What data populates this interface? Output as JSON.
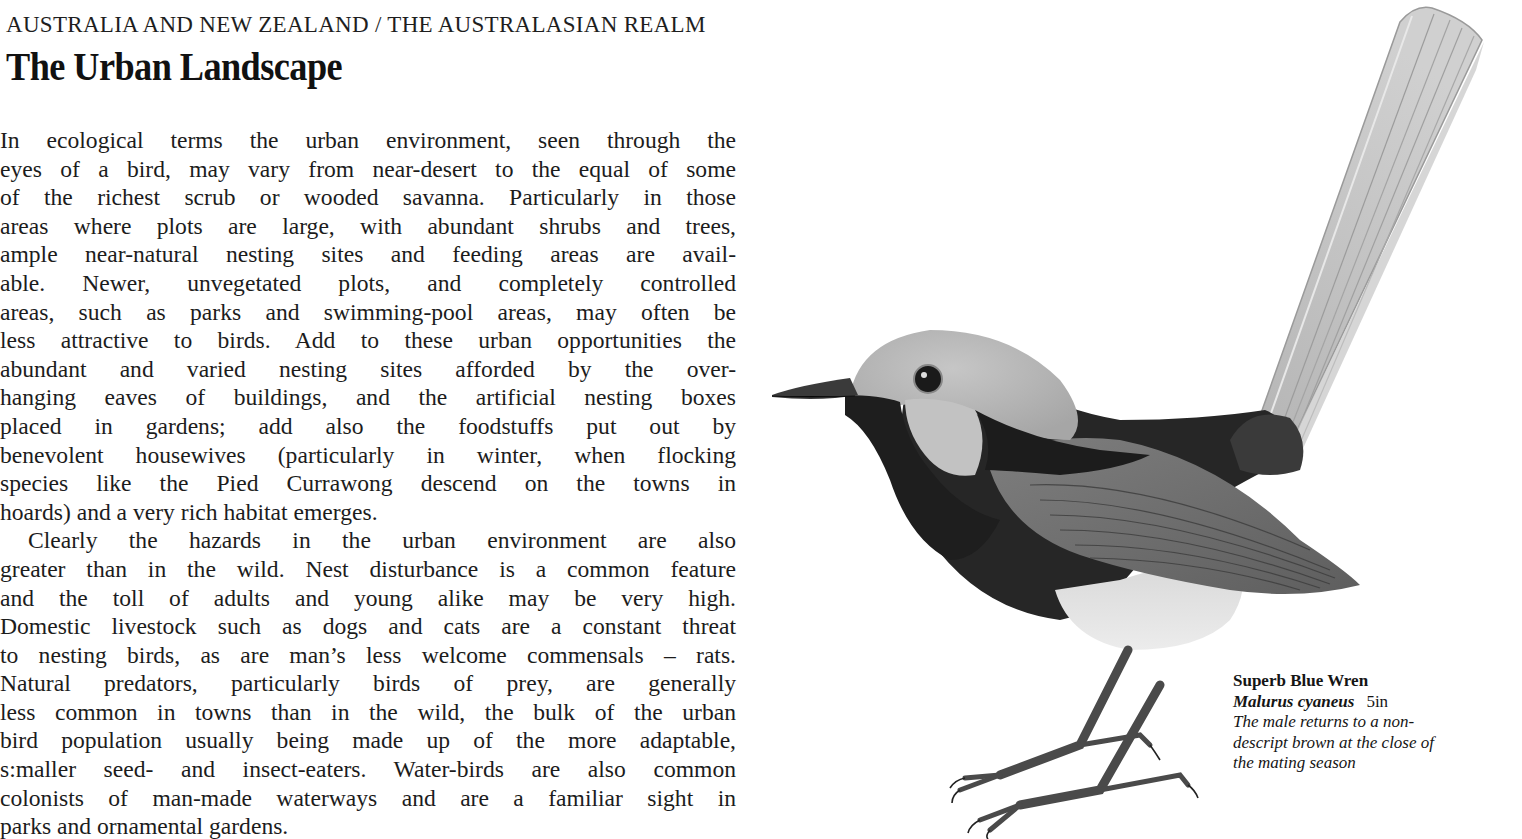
{
  "page": {
    "running_head": "AUSTRALIA AND NEW ZEALAND / THE AUSTRALASIAN REALM",
    "title": "The Urban Landscape"
  },
  "body": {
    "paragraphs": [
      {
        "lines": [
          "In ecological terms the urban environment, seen through the",
          "eyes of a bird, may vary from near-desert to the equal of some",
          "of the richest scrub or wooded savanna. Particularly in those",
          "areas where plots are large, with abundant shrubs and trees,",
          "ample near-natural nesting sites and feeding areas are avail-",
          "able. Newer, unvegetated plots, and completely controlled",
          "areas, such as parks and swimming-pool areas, may often be",
          "less attractive to birds. Add to these urban opportunities the",
          "abundant and varied nesting sites afforded by the over-",
          "hanging eaves of buildings, and the artificial nesting boxes",
          "placed in gardens; add also the foodstuffs put out by",
          "benevolent housewives (particularly in winter, when flocking",
          "species like the Pied Currawong descend on the towns in",
          "hoards) and a very rich habitat emerges."
        ]
      },
      {
        "lines": [
          "Clearly the hazards in the urban environment are also",
          "greater than in the wild. Nest disturbance is a common feature",
          "and the toll of adults and young alike may be very high.",
          "Domestic livestock such as dogs and cats are a constant threat",
          "to nesting birds, as are man’s less welcome commensals – rats.",
          "Natural predators, particularly birds of prey, are generally",
          "less common in towns than in the wild, the bulk of the urban",
          "bird population usually being made up of the more adaptable,",
          "s:maller seed- and insect-eaters. Water-birds are also common",
          "colonists of man-made waterways and are a familiar sight in",
          "parks and ornamental gardens."
        ]
      }
    ]
  },
  "figure": {
    "caption": {
      "common_name": "Superb Blue Wren",
      "latin_name": "Malurus cyaneus",
      "size": "5in",
      "description_lines": [
        "The male returns to a non-",
        "descript brown at the close of",
        "the mating season"
      ]
    }
  },
  "colors": {
    "paper": "#ffffff",
    "ink": "#1a1a1a",
    "plumage_dark": "#2a2a2a",
    "plumage_mid": "#8a8a8a",
    "plumage_light": "#c8c8c8"
  }
}
